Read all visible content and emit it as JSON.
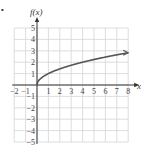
{
  "chart_data": {
    "type": "line",
    "title": "",
    "function": "f(x) = sqrt(x)",
    "xlabel": "x",
    "ylabel": "f(x)",
    "xlim": [
      -2,
      8
    ],
    "ylim": [
      -5,
      5
    ],
    "grid": true,
    "x_ticks": [
      -2,
      -1,
      1,
      2,
      3,
      4,
      5,
      6,
      7,
      8
    ],
    "y_ticks": [
      -5,
      -4,
      -3,
      -2,
      -1,
      1,
      2,
      3,
      4,
      5
    ],
    "series": [
      {
        "name": "f(x)",
        "x": [
          0,
          0.25,
          0.5,
          1,
          2,
          3,
          4,
          5,
          6,
          7,
          8
        ],
        "y": [
          0,
          0.5,
          0.71,
          1,
          1.41,
          1.73,
          2,
          2.24,
          2.45,
          2.65,
          2.83
        ],
        "color": "#555555",
        "end_arrow": true
      }
    ]
  },
  "labels": {
    "bullet": "•",
    "x_axis": "x",
    "y_axis": "f(x)"
  },
  "colors": {
    "grid": "#d4d4d4",
    "axis": "#333333",
    "curve": "#555555"
  }
}
